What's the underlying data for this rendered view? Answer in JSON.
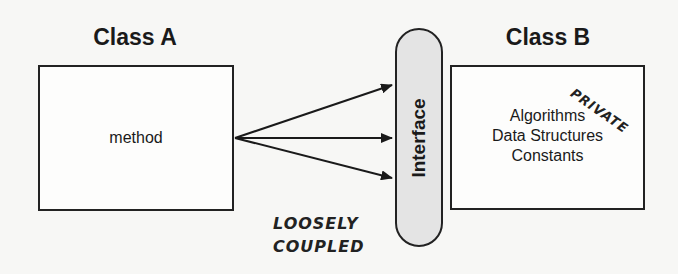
{
  "diagram": {
    "class_a": {
      "title": "Class A",
      "content": "method"
    },
    "interface": {
      "label": "Interface"
    },
    "class_b": {
      "title": "Class B",
      "contents": [
        "Algorithms",
        "Data Structures",
        "Constants"
      ],
      "annotation": "PRIVATE"
    },
    "coupling_annotation": {
      "line1": "LOOSELY",
      "line2": "COUPLED"
    },
    "arrows": [
      {
        "from": "method",
        "to": "Interface",
        "count": 3
      }
    ],
    "colors": {
      "interface_fill": "#e4e4e4",
      "stroke": "#222222",
      "background": "#f7f7f5"
    }
  }
}
